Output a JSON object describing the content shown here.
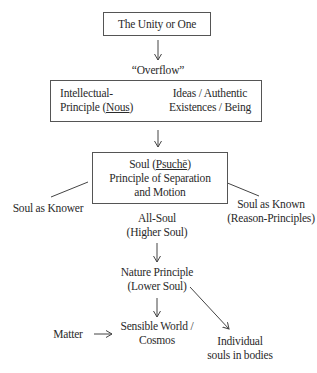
{
  "diagram": {
    "nodes": {
      "unity": {
        "label": "The Unity or One"
      },
      "overflow": {
        "label": "“Overflow”"
      },
      "intellect": {
        "line1": "Intellectual-",
        "line2_pre": "Principle (",
        "line2_term": "Nous",
        "line2_post": ")"
      },
      "ideas": {
        "line1": "Ideas / Authentic",
        "line2": "Existences / Being"
      },
      "soul": {
        "line1_pre": "Soul (",
        "line1_term": "Psuchē",
        "line1_post": ")",
        "line2": "Principle of Separation",
        "line3": "and Motion"
      },
      "soul_knower": {
        "label": "Soul as Knower"
      },
      "soul_known": {
        "line1": "Soul as Known",
        "line2": "(Reason-Principles)"
      },
      "all_soul": {
        "line1": "All-Soul",
        "line2": "(Higher Soul)"
      },
      "nature": {
        "line1": "Nature Principle",
        "line2": "(Lower Soul)"
      },
      "matter": {
        "label": "Matter"
      },
      "sensible": {
        "line1": "Sensible World /",
        "line2": "Cosmos"
      },
      "individual": {
        "line1": "Individual",
        "line2": "souls in bodies"
      }
    },
    "edges": [
      {
        "from": "unity",
        "to": "overflow",
        "type": "arrow"
      },
      {
        "from": "intellect",
        "to": "ideas",
        "type": "arrow"
      },
      {
        "from": "intellect-box",
        "to": "soul",
        "type": "arrow"
      },
      {
        "from": "soul",
        "to": "soul_knower",
        "type": "line"
      },
      {
        "from": "soul",
        "to": "soul_known",
        "type": "line"
      },
      {
        "from": "all_soul",
        "to": "nature",
        "type": "arrow"
      },
      {
        "from": "nature",
        "to": "sensible",
        "type": "arrow"
      },
      {
        "from": "nature",
        "to": "individual",
        "type": "arrow"
      },
      {
        "from": "matter",
        "to": "sensible",
        "type": "arrow"
      }
    ],
    "colors": {
      "line": "#444444",
      "text": "#2a2a2a",
      "background": "#ffffff"
    }
  }
}
